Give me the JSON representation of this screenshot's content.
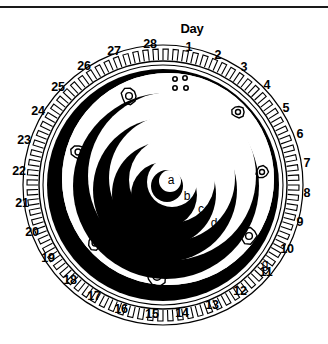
{
  "figure": {
    "title_label": "Day",
    "kind": "lunar-phase-dial",
    "colors": {
      "ink": "#000000",
      "paper": "#ffffff",
      "rule": "#1a1a1a"
    }
  },
  "dial": {
    "center_x": 163,
    "center_y": 185,
    "rim_outer_radius": 140,
    "rim_inner_radius": 120,
    "tooth_count": 28,
    "day_numbers": [
      {
        "label": "1",
        "x": 189,
        "y": 47
      },
      {
        "label": "2",
        "x": 218,
        "y": 55
      },
      {
        "label": "3",
        "x": 244,
        "y": 67
      },
      {
        "label": "4",
        "x": 267,
        "y": 85
      },
      {
        "label": "5",
        "x": 286,
        "y": 108
      },
      {
        "label": "6",
        "x": 300,
        "y": 134
      },
      {
        "label": "7",
        "x": 307,
        "y": 163
      },
      {
        "label": "8",
        "x": 307,
        "y": 193
      },
      {
        "label": "9",
        "x": 300,
        "y": 222
      },
      {
        "label": "10",
        "x": 287,
        "y": 249
      },
      {
        "label": "11",
        "x": 266,
        "y": 272
      },
      {
        "label": "12",
        "x": 240,
        "y": 291
      },
      {
        "label": "13",
        "x": 212,
        "y": 305
      },
      {
        "label": "14",
        "x": 182,
        "y": 313
      },
      {
        "label": "15",
        "x": 152,
        "y": 314
      },
      {
        "label": "16",
        "x": 121,
        "y": 309
      },
      {
        "label": "17",
        "x": 94,
        "y": 296
      },
      {
        "label": "18",
        "x": 70,
        "y": 280
      },
      {
        "label": "19",
        "x": 48,
        "y": 258
      },
      {
        "label": "20",
        "x": 32,
        "y": 232
      },
      {
        "label": "21",
        "x": 22,
        "y": 203
      },
      {
        "label": "22",
        "x": 19,
        "y": 171
      },
      {
        "label": "23",
        "x": 24,
        "y": 140
      },
      {
        "label": "24",
        "x": 38,
        "y": 111
      },
      {
        "label": "25",
        "x": 58,
        "y": 87
      },
      {
        "label": "26",
        "x": 84,
        "y": 66
      },
      {
        "label": "27",
        "x": 114,
        "y": 51
      },
      {
        "label": "28",
        "x": 150,
        "y": 44
      }
    ],
    "day_word": {
      "label": "Day",
      "x": 192,
      "y": 28
    }
  },
  "rings": [
    {
      "id": "a",
      "label": "a",
      "label_x": 171,
      "label_y": 180,
      "on_dark": false
    },
    {
      "id": "b",
      "label": "b",
      "label_x": 187,
      "label_y": 196,
      "on_dark": false
    },
    {
      "id": "c",
      "label": "c",
      "label_x": 201,
      "label_y": 209,
      "on_dark": false
    },
    {
      "id": "d",
      "label": "d",
      "label_x": 214,
      "label_y": 223,
      "on_dark": false
    },
    {
      "id": "e",
      "label": "e",
      "label_x": 235,
      "label_y": 238,
      "on_dark": false
    },
    {
      "id": "f",
      "label": "f",
      "label_x": 252,
      "label_y": 251,
      "on_dark": false
    },
    {
      "id": "g",
      "label": "g",
      "label_x": 265,
      "label_y": 264,
      "on_dark": false
    }
  ],
  "craters": [
    {
      "name": "crater-top-left",
      "cx": 129,
      "cy": 96,
      "r": 8
    },
    {
      "name": "crater-left-upper",
      "cx": 78,
      "cy": 152,
      "r": 7
    },
    {
      "name": "crater-left-lower",
      "cx": 95,
      "cy": 243,
      "r": 7
    },
    {
      "name": "crater-bottom",
      "cx": 157,
      "cy": 276,
      "r": 10
    },
    {
      "name": "crater-right-upper",
      "cx": 238,
      "cy": 112,
      "r": 6
    },
    {
      "name": "crater-right-middle",
      "cx": 262,
      "cy": 172,
      "r": 6
    },
    {
      "name": "crater-right-lower",
      "cx": 249,
      "cy": 236,
      "r": 8
    }
  ],
  "spots": [
    {
      "name": "spot-1",
      "cx": 175,
      "cy": 79,
      "r": 2.2
    },
    {
      "name": "spot-2",
      "cx": 185,
      "cy": 78,
      "r": 2.2
    },
    {
      "name": "spot-3",
      "cx": 175,
      "cy": 88,
      "r": 2.2
    },
    {
      "name": "spot-4",
      "cx": 186,
      "cy": 88,
      "r": 2.2
    }
  ]
}
